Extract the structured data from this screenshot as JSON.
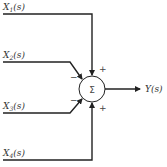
{
  "diagram": {
    "type": "summing-junction",
    "inputs": [
      {
        "label": "X1(s)",
        "sub": "1",
        "sign": "+"
      },
      {
        "label": "X2(s)",
        "sub": "2",
        "sign": "−"
      },
      {
        "label": "X3(s)",
        "sub": "3",
        "sign": "−"
      },
      {
        "label": "X4(s)",
        "sub": "4",
        "sign": "+"
      }
    ],
    "junction_symbol": "Σ",
    "output": {
      "label": "Y(s)"
    }
  }
}
